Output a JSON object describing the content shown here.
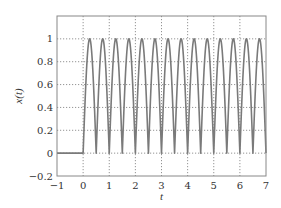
{
  "chart_data": {
    "type": "line",
    "title": "",
    "xlabel": "t",
    "ylabel": "x(t)",
    "xlim": [
      -1,
      7
    ],
    "ylim": [
      -0.2,
      1.2
    ],
    "xticks": [
      -1,
      0,
      1,
      2,
      3,
      4,
      5,
      6,
      7
    ],
    "xtick_labels": [
      "−1",
      "0",
      "1",
      "2",
      "3",
      "4",
      "5",
      "6",
      "7"
    ],
    "yticks": [
      -0.2,
      0,
      0.2,
      0.4,
      0.6,
      0.8,
      1
    ],
    "ytick_labels": [
      "−0.2",
      "0",
      "0.2",
      "0.4",
      "0.6",
      "0.8",
      "1"
    ],
    "grid": true,
    "legend": null,
    "series": [
      {
        "name": "x(t)",
        "description": "full-wave rectified sinusoid |sin(2πt)| for t ≥ 0, zero for t < 0",
        "function": "abs_sin",
        "frequency_hz": 1,
        "amplitude": 1,
        "start_t": 0,
        "period_of_arch": 0.5,
        "t_range": [
          -1,
          7
        ],
        "color": "#7a7a7a"
      }
    ]
  }
}
